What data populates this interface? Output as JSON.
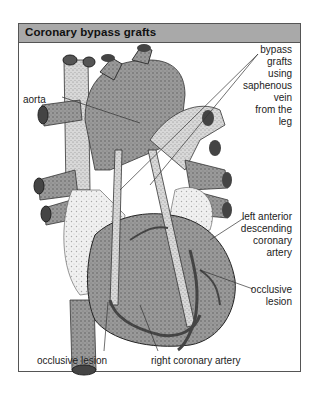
{
  "figure": {
    "title": "Coronary bypass grafts",
    "header_color": "#a9a9a9",
    "labels": {
      "bypass_grafts": [
        "bypass",
        "grafts",
        "using",
        "saphenous",
        "vein",
        "from the",
        "leg"
      ],
      "aorta": "aorta",
      "lad": [
        "left anterior",
        "descending",
        "coronary",
        "artery"
      ],
      "occlusive_lesion_right": [
        "occlusive",
        "lesion"
      ],
      "occlusive_lesion_bottom": "occlusive lesion",
      "right_coronary_artery": "right coronary artery"
    },
    "icons": [
      "heart-illustration"
    ]
  }
}
